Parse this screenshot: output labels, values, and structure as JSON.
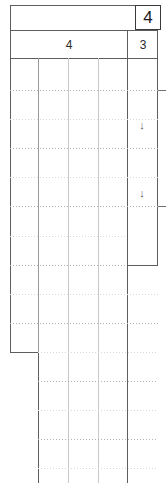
{
  "document": {
    "type": "spreadsheet-grid",
    "width": 166,
    "height": 483
  },
  "header": {
    "corner_label": "4",
    "column_group_label": "4",
    "column_single_label": "3"
  },
  "markers": {
    "arrow_down_1": "↓",
    "arrow_down_2": "↓"
  },
  "colors": {
    "grid_strong": "#5d5d5d",
    "grid_light": "#9a9a9a",
    "grid_faint": "#c9c9c9",
    "dotted": "#b4b4b4",
    "text": "#1a1a1a",
    "background": "#ffffff"
  },
  "grid": {
    "top_block": {
      "left": 10,
      "right": 158,
      "top": 5,
      "header_rule_1": 30,
      "header_rule_2": 58,
      "bottom": 352
    },
    "right_column": {
      "left": 127,
      "right": 158,
      "bottom": 265
    },
    "bottom_block": {
      "left": 38,
      "right": 158,
      "bottom": 483
    },
    "verticals": [
      10,
      38,
      68,
      98,
      127,
      158
    ],
    "dotted_rows": [
      90,
      119,
      148,
      177,
      206,
      236,
      265,
      294,
      323,
      352,
      381,
      410,
      439,
      468
    ]
  }
}
